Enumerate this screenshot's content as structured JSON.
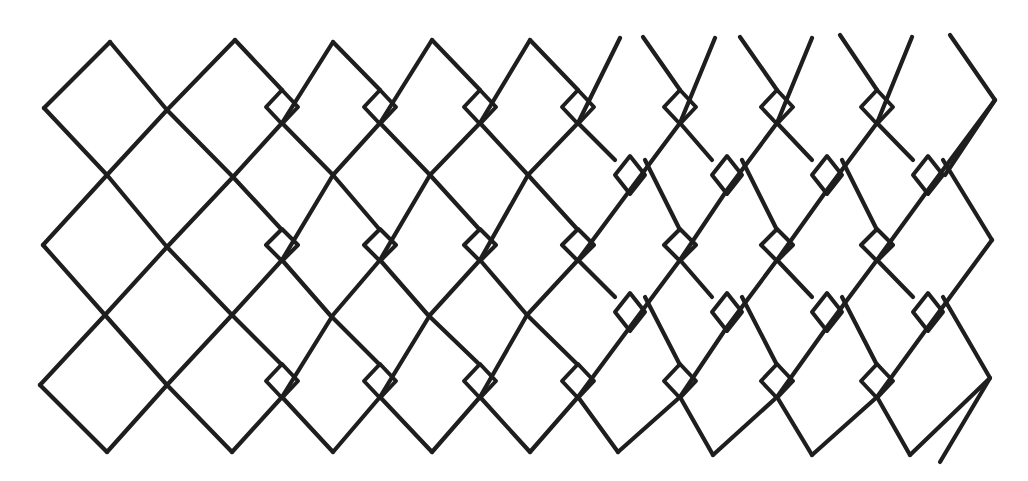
{
  "figure": {
    "title": "",
    "background": "#ffffff",
    "stroke_color": "#1e1e1e",
    "width": 1028,
    "height": 481
  },
  "lines": [
    [
      [
        44,
        108
      ],
      [
        110,
        42
      ]
    ],
    [
      [
        43,
        245
      ],
      [
        107,
        175
      ],
      [
        167,
        110
      ],
      [
        235,
        40
      ]
    ],
    [
      [
        40,
        385
      ],
      [
        105,
        315
      ],
      [
        167,
        247
      ],
      [
        233,
        177
      ],
      [
        282,
        123
      ],
      [
        333,
        42
      ]
    ],
    [
      [
        107,
        452
      ],
      [
        167,
        385
      ],
      [
        232,
        315
      ],
      [
        282,
        260
      ],
      [
        333,
        175
      ],
      [
        380,
        123
      ],
      [
        432,
        40
      ]
    ],
    [
      [
        232,
        452
      ],
      [
        282,
        397
      ],
      [
        333,
        315
      ],
      [
        380,
        260
      ],
      [
        430,
        175
      ],
      [
        480,
        123
      ],
      [
        530,
        40
      ]
    ],
    [
      [
        333,
        452
      ],
      [
        380,
        397
      ],
      [
        430,
        315
      ],
      [
        480,
        260
      ],
      [
        528,
        175
      ],
      [
        578,
        123
      ],
      [
        620,
        38
      ]
    ],
    [
      [
        432,
        452
      ],
      [
        480,
        397
      ],
      [
        527,
        315
      ],
      [
        578,
        260
      ],
      [
        630,
        190
      ],
      [
        680,
        123
      ],
      [
        715,
        38
      ]
    ],
    [
      [
        530,
        452
      ],
      [
        578,
        397
      ],
      [
        630,
        327
      ],
      [
        680,
        260
      ],
      [
        727,
        190
      ],
      [
        777,
        123
      ],
      [
        812,
        38
      ]
    ],
    [
      [
        618,
        452
      ],
      [
        680,
        397
      ],
      [
        727,
        327
      ],
      [
        777,
        260
      ],
      [
        827,
        190
      ],
      [
        877,
        123
      ],
      [
        912,
        37
      ]
    ],
    [
      [
        713,
        455
      ],
      [
        777,
        397
      ],
      [
        827,
        327
      ],
      [
        877,
        260
      ],
      [
        928,
        190
      ],
      [
        995,
        100
      ]
    ],
    [
      [
        812,
        455
      ],
      [
        877,
        397
      ],
      [
        928,
        327
      ],
      [
        992,
        240
      ]
    ],
    [
      [
        910,
        455
      ],
      [
        990,
        378
      ]
    ],
    [
      [
        110,
        42
      ],
      [
        167,
        110
      ],
      [
        233,
        177
      ],
      [
        282,
        230
      ]
    ],
    [
      [
        44,
        108
      ],
      [
        107,
        175
      ],
      [
        167,
        247
      ],
      [
        232,
        315
      ],
      [
        282,
        365
      ]
    ],
    [
      [
        43,
        245
      ],
      [
        105,
        315
      ],
      [
        167,
        385
      ],
      [
        232,
        452
      ]
    ],
    [
      [
        40,
        385
      ],
      [
        107,
        452
      ]
    ],
    [
      [
        235,
        40
      ],
      [
        282,
        90
      ]
    ],
    [
      [
        282,
        123
      ],
      [
        333,
        175
      ],
      [
        380,
        230
      ]
    ],
    [
      [
        282,
        260
      ],
      [
        330,
        315
      ],
      [
        380,
        365
      ]
    ],
    [
      [
        282,
        397
      ],
      [
        333,
        452
      ]
    ],
    [
      [
        333,
        42
      ],
      [
        380,
        90
      ]
    ],
    [
      [
        380,
        123
      ],
      [
        430,
        175
      ],
      [
        480,
        230
      ]
    ],
    [
      [
        380,
        260
      ],
      [
        428,
        315
      ],
      [
        480,
        365
      ]
    ],
    [
      [
        380,
        397
      ],
      [
        432,
        452
      ]
    ],
    [
      [
        432,
        40
      ],
      [
        480,
        90
      ]
    ],
    [
      [
        480,
        123
      ],
      [
        528,
        175
      ],
      [
        578,
        230
      ]
    ],
    [
      [
        480,
        260
      ],
      [
        527,
        315
      ],
      [
        578,
        365
      ]
    ],
    [
      [
        480,
        397
      ],
      [
        530,
        452
      ]
    ],
    [
      [
        530,
        40
      ],
      [
        578,
        90
      ]
    ],
    [
      [
        578,
        123
      ],
      [
        615,
        160
      ]
    ],
    [
      [
        645,
        160
      ],
      [
        680,
        230
      ]
    ],
    [
      [
        578,
        260
      ],
      [
        615,
        297
      ]
    ],
    [
      [
        645,
        297
      ],
      [
        680,
        365
      ]
    ],
    [
      [
        578,
        397
      ],
      [
        618,
        452
      ]
    ],
    [
      [
        643,
        37
      ],
      [
        680,
        90
      ]
    ],
    [
      [
        680,
        123
      ],
      [
        712,
        160
      ]
    ],
    [
      [
        742,
        160
      ],
      [
        777,
        230
      ]
    ],
    [
      [
        680,
        260
      ],
      [
        712,
        297
      ]
    ],
    [
      [
        742,
        297
      ],
      [
        777,
        365
      ]
    ],
    [
      [
        680,
        397
      ],
      [
        713,
        455
      ]
    ],
    [
      [
        740,
        37
      ],
      [
        777,
        90
      ]
    ],
    [
      [
        777,
        123
      ],
      [
        812,
        160
      ]
    ],
    [
      [
        842,
        160
      ],
      [
        877,
        230
      ]
    ],
    [
      [
        777,
        260
      ],
      [
        812,
        297
      ]
    ],
    [
      [
        842,
        297
      ],
      [
        877,
        365
      ]
    ],
    [
      [
        777,
        397
      ],
      [
        812,
        455
      ]
    ],
    [
      [
        840,
        35
      ],
      [
        877,
        90
      ]
    ],
    [
      [
        877,
        123
      ],
      [
        913,
        160
      ]
    ],
    [
      [
        943,
        160
      ],
      [
        992,
        240
      ]
    ],
    [
      [
        877,
        260
      ],
      [
        913,
        297
      ]
    ],
    [
      [
        943,
        297
      ],
      [
        990,
        378
      ],
      [
        940,
        462
      ]
    ],
    [
      [
        877,
        397
      ],
      [
        910,
        455
      ]
    ],
    [
      [
        950,
        35
      ],
      [
        995,
        100
      ],
      [
        945,
        175
      ]
    ]
  ],
  "small_diamonds": [
    {
      "cx": 282,
      "cy": 107,
      "rx": 16,
      "ry": 17
    },
    {
      "cx": 380,
      "cy": 107,
      "rx": 16,
      "ry": 17
    },
    {
      "cx": 480,
      "cy": 107,
      "rx": 16,
      "ry": 17
    },
    {
      "cx": 578,
      "cy": 107,
      "rx": 16,
      "ry": 17
    },
    {
      "cx": 680,
      "cy": 107,
      "rx": 16,
      "ry": 17
    },
    {
      "cx": 777,
      "cy": 107,
      "rx": 16,
      "ry": 17
    },
    {
      "cx": 877,
      "cy": 107,
      "rx": 16,
      "ry": 17
    },
    {
      "cx": 282,
      "cy": 245,
      "rx": 16,
      "ry": 16
    },
    {
      "cx": 380,
      "cy": 245,
      "rx": 16,
      "ry": 16
    },
    {
      "cx": 480,
      "cy": 245,
      "rx": 16,
      "ry": 16
    },
    {
      "cx": 578,
      "cy": 245,
      "rx": 16,
      "ry": 16
    },
    {
      "cx": 680,
      "cy": 245,
      "rx": 16,
      "ry": 16
    },
    {
      "cx": 777,
      "cy": 245,
      "rx": 16,
      "ry": 16
    },
    {
      "cx": 877,
      "cy": 245,
      "rx": 16,
      "ry": 16
    },
    {
      "cx": 282,
      "cy": 381,
      "rx": 16,
      "ry": 17
    },
    {
      "cx": 380,
      "cy": 381,
      "rx": 16,
      "ry": 17
    },
    {
      "cx": 480,
      "cy": 381,
      "rx": 16,
      "ry": 17
    },
    {
      "cx": 578,
      "cy": 381,
      "rx": 16,
      "ry": 17
    },
    {
      "cx": 680,
      "cy": 381,
      "rx": 16,
      "ry": 17
    },
    {
      "cx": 777,
      "cy": 381,
      "rx": 16,
      "ry": 17
    },
    {
      "cx": 877,
      "cy": 381,
      "rx": 16,
      "ry": 17
    },
    {
      "cx": 630,
      "cy": 175,
      "rx": 15,
      "ry": 19
    },
    {
      "cx": 727,
      "cy": 175,
      "rx": 15,
      "ry": 19
    },
    {
      "cx": 827,
      "cy": 175,
      "rx": 15,
      "ry": 19
    },
    {
      "cx": 928,
      "cy": 175,
      "rx": 15,
      "ry": 19
    },
    {
      "cx": 630,
      "cy": 312,
      "rx": 15,
      "ry": 19
    },
    {
      "cx": 727,
      "cy": 312,
      "rx": 15,
      "ry": 19
    },
    {
      "cx": 827,
      "cy": 312,
      "rx": 15,
      "ry": 19
    },
    {
      "cx": 928,
      "cy": 312,
      "rx": 15,
      "ry": 19
    }
  ]
}
